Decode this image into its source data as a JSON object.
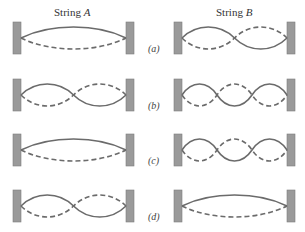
{
  "figure": {
    "column_titles": [
      {
        "prefix": "String ",
        "var": "A"
      },
      {
        "prefix": "String ",
        "var": "B"
      }
    ],
    "rows": [
      {
        "label": "(a)",
        "string_a_loops": 1,
        "string_b_loops": 2
      },
      {
        "label": "(b)",
        "string_a_loops": 2,
        "string_b_loops": 3
      },
      {
        "label": "(c)",
        "string_a_loops": 1,
        "string_b_loops": 3
      },
      {
        "label": "(d)",
        "string_a_loops": 2,
        "string_b_loops": 1
      }
    ],
    "colors": {
      "wall": "#9a9a9a",
      "string": "#6b6b6b",
      "background": "#ffffff"
    },
    "legend": {
      "solid_line": "string displacement (one extreme)",
      "dashed_line": "string displacement (opposite extreme)"
    }
  }
}
